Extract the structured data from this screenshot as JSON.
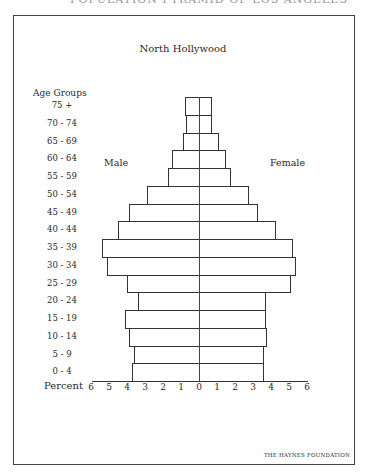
{
  "page": {
    "top_cut_text": "POPULATION PYRAMID OF LOS ANGELES",
    "bottom_cut_text": "",
    "footer": "THE HAYNES FOUNDATION"
  },
  "chart_data": {
    "type": "bar",
    "orientation": "horizontal",
    "subtype": "population-pyramid",
    "title": "North Hollywood",
    "ylabel": "Age Groups",
    "xlabel": "Percent",
    "xlim": [
      -6,
      6
    ],
    "x_ticks": [
      "6",
      "5",
      "4",
      "3",
      "2",
      "1",
      "0",
      "1",
      "2",
      "3",
      "4",
      "5",
      "6"
    ],
    "legend": [
      "Male",
      "Female"
    ],
    "categories": [
      "75 +",
      "70 - 74",
      "65 - 69",
      "60 - 64",
      "55 - 59",
      "50 - 54",
      "45 - 49",
      "40 - 44",
      "35 - 39",
      "30 - 34",
      "25 - 29",
      "20 - 24",
      "15 - 19",
      "10 - 14",
      "5 - 9",
      "0 - 4"
    ],
    "series": [
      {
        "name": "Male",
        "side": "left",
        "values": [
          0.8,
          0.7,
          0.9,
          1.5,
          1.7,
          2.9,
          3.9,
          4.5,
          5.4,
          5.1,
          4.0,
          3.4,
          4.1,
          3.9,
          3.6,
          3.7
        ]
      },
      {
        "name": "Female",
        "side": "right",
        "values": [
          0.7,
          0.7,
          1.1,
          1.5,
          1.8,
          2.8,
          3.3,
          4.3,
          5.2,
          5.4,
          5.1,
          3.7,
          3.7,
          3.8,
          3.6,
          3.6
        ]
      }
    ],
    "grid": false
  }
}
